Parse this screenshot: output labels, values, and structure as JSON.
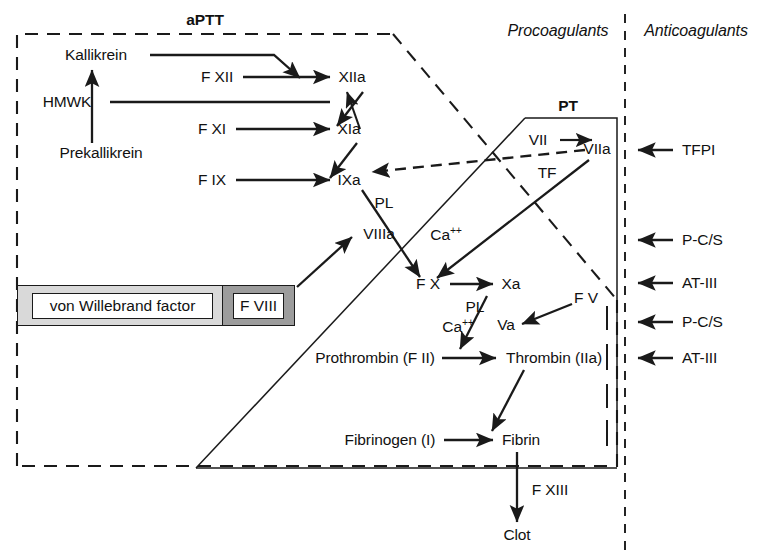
{
  "diagram": {
    "regions": {
      "aptt_label": "aPTT",
      "pt_label": "PT",
      "procoagulants_label": "Procoagulants",
      "anticoagulants_label": "Anticoagulants"
    },
    "colors": {
      "line": "#1a1a1a",
      "text": "#111111",
      "background": "#ffffff",
      "vwf_fill": "#d9d9d9",
      "fviii_fill": "#9c9c9c"
    },
    "intrinsic_pathway": {
      "kallikrein": "Kallikrein",
      "hmwk": "HMWK",
      "prekallikrein": "Prekallikrein",
      "f_xii": "F XII",
      "xiia": "XIIa",
      "f_xi": "F XI",
      "xia": "XIa",
      "f_ix": "F IX",
      "ixa": "IXa",
      "viiia": "VIIIa"
    },
    "extrinsic_pathway": {
      "vii": "VII",
      "viia": "VIIa",
      "tf": "TF"
    },
    "common_pathway": {
      "f_x": "F X",
      "xa": "Xa",
      "f_v": "F V",
      "va": "Va",
      "prothrombin": "Prothrombin (F II)",
      "thrombin": "Thrombin (IIa)",
      "fibrinogen": "Fibrinogen (I)",
      "fibrin": "Fibrin",
      "f_xiii": "F XIII",
      "clot": "Clot"
    },
    "cofactors": {
      "pl_upper": "PL",
      "ca_upper": "Ca",
      "ca_upper_charge": "++",
      "pl_lower": "PL",
      "ca_lower": "Ca",
      "ca_lower_charge": "++"
    },
    "factor_boxes": [
      {
        "name": "von-willebrand-factor-box",
        "label": "von Willebrand factor"
      },
      {
        "name": "f-viii-box",
        "label": "F VIII"
      }
    ],
    "anticoagulants": [
      {
        "label": "TFPI"
      },
      {
        "label": "P-C/S"
      },
      {
        "label": "AT-III"
      },
      {
        "label": "P-C/S"
      },
      {
        "label": "AT-III"
      }
    ]
  }
}
